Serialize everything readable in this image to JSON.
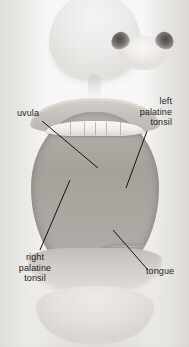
{
  "figure": {
    "style": "grayscale anatomical photograph with leader-line labels",
    "width": 189,
    "height": 347,
    "background_color": "#f4f3f1",
    "label_color": "#1b1b1b",
    "leader_color": "#141414"
  },
  "labels": [
    {
      "id": "uvula",
      "text": "uvula",
      "align": "left",
      "leader": {
        "x1": 42,
        "y1": 121,
        "x2": 98,
        "y2": 168
      }
    },
    {
      "id": "left-palatine-tonsil",
      "text": "left\npalatine\ntonsil",
      "align": "right",
      "leader": {
        "x1": 147,
        "y1": 131,
        "x2": 126,
        "y2": 188
      }
    },
    {
      "id": "right-palatine-tonsil",
      "text": "right\npalatine\ntonsil",
      "align": "center",
      "leader": {
        "x1": 70,
        "y1": 180,
        "x2": 40,
        "y2": 250
      }
    },
    {
      "id": "tongue",
      "text": "tongue",
      "align": "left",
      "leader": {
        "x1": 113,
        "y1": 230,
        "x2": 148,
        "y2": 270
      }
    }
  ],
  "anatomy": {
    "nose": "nose with two nostrils",
    "upper_lip": "upper lip",
    "lower_lip": "lower lip",
    "chin": "chin",
    "upper_teeth": "upper incisors and canines",
    "lower_teeth": "lower incisors",
    "hard_palate": "hard palate with transverse rugae",
    "soft_palate": "soft palate arch",
    "uvula": "uvula",
    "oropharynx": "oropharynx (dark throat opening)",
    "left_palatine_tonsil": "left palatine tonsil",
    "right_palatine_tonsil": "right palatine tonsil",
    "tongue": "tongue dorsum with papillae and median sulcus"
  }
}
